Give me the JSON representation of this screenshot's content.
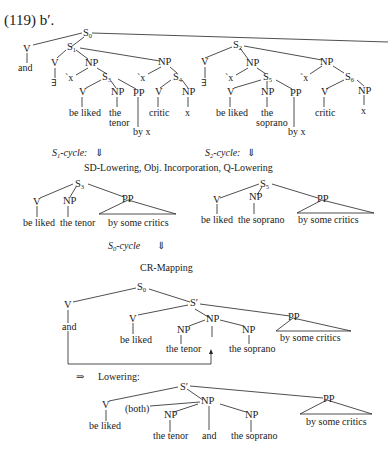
{
  "caption": "(119) b′.",
  "tree1": {
    "root": "S",
    "root_sub": "0",
    "and_v": "V",
    "and_leaf": "and",
    "left": {
      "s": "S",
      "s_sub": "1",
      "v": "V",
      "exists": "∃",
      "np": "NP",
      "x": "ˋx",
      "s_inner": "S",
      "s_inner_sub": "3",
      "v2": "V",
      "v2_leaf": "be liked",
      "np2": "NP",
      "np2_leaf_1": "the",
      "np2_leaf_2": "tenor",
      "pp": "PP",
      "pp_leaf": "by x",
      "np3": "NP",
      "x3": "ˋx",
      "s4": "S",
      "s4_sub": "4",
      "v4": "V",
      "v4_leaf": "critic",
      "np4": "NP",
      "np4_leaf": "x"
    },
    "right": {
      "s": "S",
      "s_sub": "2",
      "v": "V",
      "exists": "∃",
      "np": "NP",
      "x": "ˋx",
      "s_inner": "S",
      "s_inner_sub": "5",
      "v2": "V",
      "v2_leaf": "be liked",
      "np2": "NP",
      "np2_leaf_1": "the",
      "np2_leaf_2": "soprano",
      "pp": "PP",
      "pp_leaf": "by x",
      "np3": "NP",
      "x3": "ˋx",
      "s6": "S",
      "s6_sub": "6",
      "v6": "V",
      "v6_leaf": "critic",
      "np6": "NP",
      "np6_leaf": "x"
    }
  },
  "cycles": {
    "s1_label": "S",
    "s1_sub": "1",
    "s1_suffix": "-cycle:",
    "s2_label": "S",
    "s2_sub": "2",
    "s2_suffix": "-cycle:",
    "arrow_down": "⇓",
    "rules_line": "SD-Lowering, Obj. Incorporation, Q-Lowering",
    "s0_label": "S",
    "s0_sub": "0",
    "s0_suffix": "-cycle",
    "cr_mapping": "CR-Mapping",
    "lowering_arrow": "⇒",
    "lowering": "Lowering:"
  },
  "tree2": {
    "s": "S",
    "s_sub": "3",
    "v": "V",
    "v_leaf": "be liked",
    "np": "NP",
    "np_leaf": "the tenor",
    "pp": "PP",
    "pp_leaf": "by some critics"
  },
  "tree3": {
    "s": "S",
    "s_sub": "5",
    "v": "V",
    "v_leaf": "be liked",
    "np": "NP",
    "np_leaf": "the soprano",
    "pp": "PP",
    "pp_leaf": "by some critics"
  },
  "tree4": {
    "s0": "S",
    "s0_sub": "0",
    "v_and": "V",
    "and_leaf": "and",
    "sprime": "S′",
    "v": "V",
    "v_leaf": "be liked",
    "np_top": "NP",
    "np_left": "NP",
    "np_left_leaf": "the tenor",
    "np_right": "NP",
    "np_right_leaf": "the soprano",
    "dash": "–",
    "pp": "PP",
    "pp_leaf": "by some critics"
  },
  "tree5": {
    "sprime": "S′",
    "v": "V",
    "v_leaf": "be liked",
    "both": "(both)",
    "np_top": "NP",
    "np_left": "NP",
    "np_left_leaf": "the tenor",
    "and_leaf": "and",
    "np_right": "NP",
    "np_right_leaf": "the soprano",
    "pp": "PP",
    "pp_leaf": "by some critics"
  }
}
